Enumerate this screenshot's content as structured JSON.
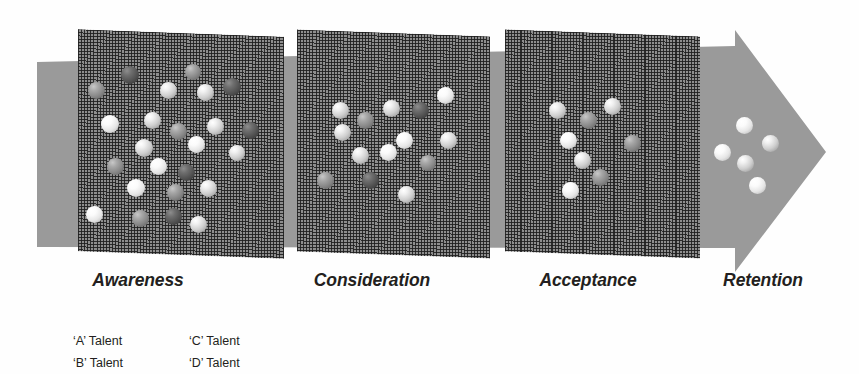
{
  "figure": {
    "background_color": "#ffffff",
    "arrow_color": "#9a9a9a",
    "mesh_color": "#8e8e8e",
    "text_color": "#231f20"
  },
  "stages": [
    {
      "id": "awareness",
      "label": "Awareness",
      "sphere_count": 24,
      "label_center_x": 138,
      "label_top": 270
    },
    {
      "id": "consideration",
      "label": "Consideration",
      "sphere_count": 14,
      "label_center_x": 372,
      "label_top": 270
    },
    {
      "id": "acceptance",
      "label": "Acceptance",
      "sphere_count": 8,
      "label_center_x": 588,
      "label_top": 270
    },
    {
      "id": "retention",
      "label": "Retention",
      "sphere_count": 5,
      "label_center_x": 763,
      "label_top": 270
    }
  ],
  "legend": {
    "items": [
      {
        "id": "a-talent",
        "label": "‘A’ Talent",
        "grade": "A",
        "color": "#d6d6d6",
        "left": 0,
        "top": 0
      },
      {
        "id": "b-talent",
        "label": "‘B’ Talent",
        "grade": "B",
        "color": "#eaeaea",
        "left": 0,
        "top": 22
      },
      {
        "id": "c-talent",
        "label": "‘C’ Talent",
        "grade": "C",
        "color": "#8a8a8a",
        "left": 116,
        "top": 0
      },
      {
        "id": "d-talent",
        "label": "‘D’ Talent",
        "grade": "D",
        "color": "#4f4f4f",
        "left": 116,
        "top": 22
      }
    ]
  },
  "chart_data": {
    "type": "diagram",
    "subtype": "funnel",
    "categories": [
      "Awareness",
      "Consideration",
      "Acceptance",
      "Retention"
    ],
    "values": [
      24,
      14,
      8,
      5
    ],
    "ylabel": "Number of talent candidates",
    "xlabel": "Funnel stage",
    "legend_position": "bottom-left",
    "series": [
      {
        "name": "'A' Talent",
        "values": [
          7,
          6,
          4,
          3
        ]
      },
      {
        "name": "'B' Talent",
        "values": [
          6,
          4,
          2,
          2
        ]
      },
      {
        "name": "'C' Talent",
        "values": [
          6,
          3,
          2,
          0
        ]
      },
      {
        "name": "'D' Talent",
        "values": [
          5,
          1,
          0,
          0
        ]
      }
    ],
    "annotations": [
      "Mesh screens between stages act as filters",
      "Only 'A' and 'B' talent reach Retention"
    ]
  },
  "spheres": {
    "awareness": [
      {
        "g": "C",
        "x": 96,
        "y": 90,
        "d": 17
      },
      {
        "g": "D",
        "x": 130,
        "y": 75,
        "d": 18
      },
      {
        "g": "A",
        "x": 168,
        "y": 90,
        "d": 17
      },
      {
        "g": "C",
        "x": 193,
        "y": 72,
        "d": 16
      },
      {
        "g": "A",
        "x": 205,
        "y": 92,
        "d": 17
      },
      {
        "g": "D",
        "x": 232,
        "y": 87,
        "d": 18
      },
      {
        "g": "B",
        "x": 110,
        "y": 124,
        "d": 18
      },
      {
        "g": "A",
        "x": 152,
        "y": 120,
        "d": 17
      },
      {
        "g": "C",
        "x": 178,
        "y": 131,
        "d": 17
      },
      {
        "g": "A",
        "x": 215,
        "y": 126,
        "d": 17
      },
      {
        "g": "D",
        "x": 250,
        "y": 130,
        "d": 17
      },
      {
        "g": "B",
        "x": 196,
        "y": 144,
        "d": 17
      },
      {
        "g": "A",
        "x": 144,
        "y": 148,
        "d": 18
      },
      {
        "g": "A",
        "x": 237,
        "y": 153,
        "d": 16
      },
      {
        "g": "C",
        "x": 115,
        "y": 166,
        "d": 17
      },
      {
        "g": "B",
        "x": 158,
        "y": 166,
        "d": 17
      },
      {
        "g": "D",
        "x": 186,
        "y": 172,
        "d": 17
      },
      {
        "g": "B",
        "x": 136,
        "y": 188,
        "d": 18
      },
      {
        "g": "C",
        "x": 175,
        "y": 192,
        "d": 17
      },
      {
        "g": "A",
        "x": 208,
        "y": 188,
        "d": 17
      },
      {
        "g": "B",
        "x": 94,
        "y": 214,
        "d": 17
      },
      {
        "g": "C",
        "x": 140,
        "y": 218,
        "d": 17
      },
      {
        "g": "D",
        "x": 173,
        "y": 216,
        "d": 17
      },
      {
        "g": "A",
        "x": 198,
        "y": 224,
        "d": 17
      }
    ],
    "consideration": [
      {
        "g": "A",
        "x": 340,
        "y": 110,
        "d": 17
      },
      {
        "g": "A",
        "x": 391,
        "y": 108,
        "d": 17
      },
      {
        "g": "D",
        "x": 420,
        "y": 110,
        "d": 17
      },
      {
        "g": "B",
        "x": 445,
        "y": 95,
        "d": 17
      },
      {
        "g": "C",
        "x": 365,
        "y": 120,
        "d": 17
      },
      {
        "g": "A",
        "x": 342,
        "y": 132,
        "d": 17
      },
      {
        "g": "B",
        "x": 404,
        "y": 140,
        "d": 17
      },
      {
        "g": "A",
        "x": 448,
        "y": 140,
        "d": 17
      },
      {
        "g": "A",
        "x": 360,
        "y": 155,
        "d": 17
      },
      {
        "g": "B",
        "x": 388,
        "y": 152,
        "d": 17
      },
      {
        "g": "C",
        "x": 428,
        "y": 163,
        "d": 16
      },
      {
        "g": "C",
        "x": 325,
        "y": 180,
        "d": 17
      },
      {
        "g": "D",
        "x": 370,
        "y": 180,
        "d": 17
      },
      {
        "g": "A",
        "x": 406,
        "y": 194,
        "d": 17
      }
    ],
    "acceptance": [
      {
        "g": "A",
        "x": 557,
        "y": 110,
        "d": 17
      },
      {
        "g": "A",
        "x": 612,
        "y": 106,
        "d": 17
      },
      {
        "g": "C",
        "x": 588,
        "y": 120,
        "d": 17
      },
      {
        "g": "B",
        "x": 568,
        "y": 140,
        "d": 17
      },
      {
        "g": "C",
        "x": 632,
        "y": 143,
        "d": 17
      },
      {
        "g": "A",
        "x": 582,
        "y": 160,
        "d": 17
      },
      {
        "g": "C",
        "x": 600,
        "y": 177,
        "d": 17
      },
      {
        "g": "B",
        "x": 570,
        "y": 190,
        "d": 17
      }
    ],
    "retention": [
      {
        "g": "B",
        "x": 744,
        "y": 125,
        "d": 17
      },
      {
        "g": "A",
        "x": 770,
        "y": 143,
        "d": 17
      },
      {
        "g": "B",
        "x": 722,
        "y": 152,
        "d": 17
      },
      {
        "g": "A",
        "x": 745,
        "y": 163,
        "d": 17
      },
      {
        "g": "B",
        "x": 757,
        "y": 185,
        "d": 17
      }
    ]
  }
}
